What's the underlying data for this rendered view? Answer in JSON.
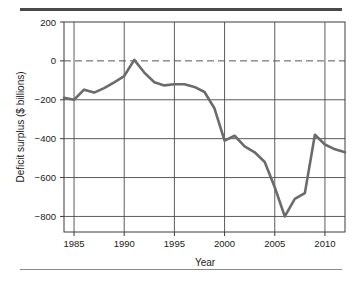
{
  "figure": {
    "top_rule_color": "#4a4a4a",
    "bottom_rule_color": "#8a8a8a",
    "line_color": "#6b6b6b",
    "grid_color": "#4a4a4a",
    "frame_color": "#3c3c3c"
  },
  "chart_data": {
    "type": "line",
    "title": "",
    "xlabel": "Year",
    "ylabel": "Deficit surplus ($ billions)",
    "xlim": [
      1984,
      2012
    ],
    "ylim": [
      -880,
      200
    ],
    "grid": true,
    "legend": "none",
    "zero_reference_line": {
      "value": 0,
      "style": "dashed"
    },
    "xticks": [
      1985,
      1990,
      1995,
      2000,
      2005,
      2010
    ],
    "xtick_labels": [
      "1985",
      "1990",
      "1995",
      "2000",
      "2005",
      "2010"
    ],
    "yticks": [
      200,
      0,
      -200,
      -400,
      -600,
      -800
    ],
    "ytick_labels": [
      "200",
      "0",
      "−200",
      "−400",
      "−600",
      "−800"
    ],
    "series": [
      {
        "name": "Deficit surplus",
        "color": "#6b6b6b",
        "x": [
          1984,
          1985,
          1986,
          1987,
          1988,
          1989,
          1990,
          1991,
          1992,
          1993,
          1994,
          1995,
          1996,
          1997,
          1998,
          1999,
          2000,
          2001,
          2002,
          2003,
          2004,
          2005,
          2006,
          2007,
          2008,
          2009,
          2010,
          2011,
          2012
        ],
        "values": [
          -190,
          -200,
          -148,
          -163,
          -140,
          -110,
          -78,
          5,
          -60,
          -110,
          -126,
          -120,
          -120,
          -134,
          -160,
          -245,
          -410,
          -385,
          -440,
          -470,
          -520,
          -650,
          -800,
          -710,
          -680,
          -380,
          -430,
          -455,
          -470
        ]
      }
    ]
  }
}
